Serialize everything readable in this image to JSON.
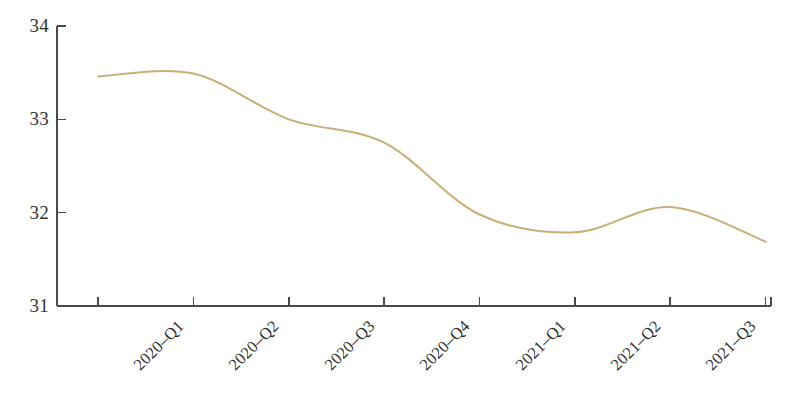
{
  "chart_data": {
    "type": "line",
    "title": "",
    "subtitle": "",
    "xlabel": "",
    "ylabel": "",
    "categories": [
      "2020–Q1",
      "2020–Q2",
      "2020–Q3",
      "2020–Q4",
      "2021–Q1",
      "2021–Q2",
      "2021–Q3",
      "2021–Q4"
    ],
    "values": [
      33.46,
      33.49,
      33.0,
      32.75,
      31.98,
      31.79,
      32.06,
      31.69
    ],
    "series": [
      {
        "name": "series-1",
        "color": "#c9ae78",
        "values": [
          33.46,
          33.49,
          33.0,
          32.75,
          31.98,
          31.79,
          32.06,
          31.69
        ]
      }
    ],
    "x_tick_labels": [
      "2020–Q1",
      "2020–Q2",
      "2020–Q3",
      "2020–Q4",
      "2021–Q1",
      "2021–Q2",
      "2021–Q3",
      "2021–Q4"
    ],
    "y_tick_labels": [
      "31",
      "32",
      "33",
      "34"
    ],
    "y_tick_values": [
      31,
      32,
      33,
      34
    ],
    "ylim": [
      31,
      34
    ],
    "xlim": [
      0,
      7
    ],
    "grid": false,
    "legend": false,
    "legend_position": "none",
    "smoothing": "spline",
    "line_width": 2,
    "annotations": []
  },
  "style": {
    "line_color": "#c9ae78",
    "axis_color": "#4a4a4a",
    "text_color": "#333333",
    "background": "#ffffff"
  }
}
